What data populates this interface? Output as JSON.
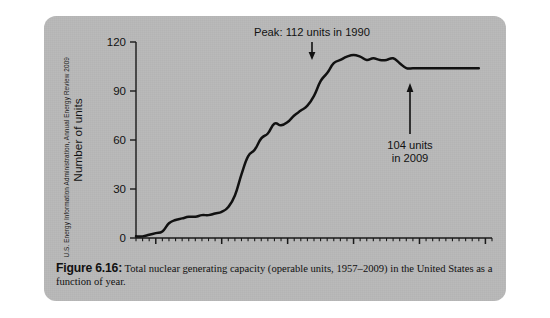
{
  "credit": {
    "text": "U.S. Energy Information Administration, Annual Energy Review 2009"
  },
  "caption": {
    "label": "Figure 6.16:",
    "body": " Total nuclear generating capacity (operable units, 1957–2009) in the United States as a function of year."
  },
  "colors": {
    "panel_bg": "#b9b9b9",
    "page_bg": "#ffffff",
    "line": "#111111",
    "axis": "#1a1a1a",
    "text": "#121212"
  },
  "chart_data": {
    "type": "line",
    "title": "",
    "xlabel": "",
    "ylabel": "Number of units",
    "xlim": [
      1957,
      2011
    ],
    "ylim": [
      0,
      120
    ],
    "xticks": [
      1960,
      1970,
      1980,
      1990,
      2000,
      2010
    ],
    "xtick_labels": [
      "1960",
      "1970",
      "1980",
      "1990",
      "2000",
      "2010"
    ],
    "minor_xtick_step": 1,
    "yticks": [
      0,
      30,
      60,
      90,
      120
    ],
    "ytick_labels": [
      "0",
      "30",
      "60",
      "90",
      "120"
    ],
    "grid": false,
    "legend": "none",
    "series": [
      {
        "name": "Operable nuclear units",
        "x": [
          1957,
          1958,
          1959,
          1960,
          1961,
          1962,
          1963,
          1964,
          1965,
          1966,
          1967,
          1968,
          1969,
          1970,
          1971,
          1972,
          1973,
          1974,
          1975,
          1976,
          1977,
          1978,
          1979,
          1980,
          1981,
          1982,
          1983,
          1984,
          1985,
          1986,
          1987,
          1988,
          1989,
          1990,
          1991,
          1992,
          1993,
          1994,
          1995,
          1996,
          1997,
          1998,
          1999,
          2000,
          2001,
          2002,
          2003,
          2004,
          2005,
          2006,
          2007,
          2008,
          2009
        ],
        "y": [
          1,
          1,
          2,
          3,
          4,
          9,
          11,
          12,
          13,
          13,
          14,
          14,
          15,
          16,
          19,
          26,
          39,
          50,
          54,
          61,
          64,
          70,
          69,
          71,
          75,
          78,
          81,
          87,
          96,
          101,
          107,
          109,
          111,
          112,
          111,
          109,
          110,
          109,
          109,
          110,
          107,
          104,
          104,
          104,
          104,
          104,
          104,
          104,
          104,
          104,
          104,
          104,
          104
        ]
      }
    ],
    "annotations": [
      {
        "id": "peak",
        "text": "Peak: 112 units in 1990",
        "value": 112,
        "year": 1990,
        "arrow": "down"
      },
      {
        "id": "final",
        "text_line1": "104 units",
        "text_line2": "in 2009",
        "value": 104,
        "year": 2009,
        "arrow": "up"
      }
    ]
  }
}
